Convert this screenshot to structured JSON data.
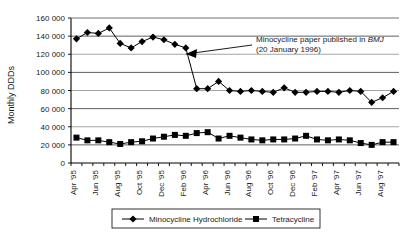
{
  "chart_data": {
    "type": "line",
    "title": "",
    "xlabel": "",
    "ylabel": "Monthly DDDs",
    "ylim": [
      0,
      160000
    ],
    "ytick_step": 20000,
    "grid": true,
    "legend_position": "bottom",
    "ytick_labels": [
      "0",
      "20 000",
      "40 000",
      "60 000",
      "80 000",
      "100 000",
      "120 000",
      "140 000",
      "160 000"
    ],
    "ytick_values": [
      0,
      20000,
      40000,
      60000,
      80000,
      100000,
      120000,
      140000,
      160000
    ],
    "x": [
      "Apr '95",
      "May '95",
      "Jun '95",
      "Jul '95",
      "Aug '95",
      "Sep '95",
      "Oct '95",
      "Nov '95",
      "Dec '95",
      "Jan '96",
      "Feb '96",
      "Mar '96",
      "Apr '96",
      "May '96",
      "Jun '96",
      "Jul '96",
      "Aug '96",
      "Sep '96",
      "Oct '96",
      "Nov '96",
      "Dec '96",
      "Jan '97",
      "Feb '97",
      "Mar '97",
      "Apr '97",
      "May '97",
      "Jun '97",
      "Jul '97",
      "Aug '97",
      "Sep '97"
    ],
    "xtick_labels": [
      "Apr '95",
      "",
      "Jun '95",
      "",
      "Aug '95",
      "",
      "Oct '95",
      "",
      "Dec '95",
      "",
      "Feb '96",
      "",
      "Apr '96",
      "",
      "Jun '96",
      "",
      "Aug '96",
      "",
      "Oct '96",
      "",
      "Dec '96",
      "",
      "Feb '97",
      "",
      "Apr '97",
      "",
      "Jun '97",
      "",
      "Aug '97",
      ""
    ],
    "xtick_labels_visible": [
      "Apr '95",
      "Jun '95",
      "Aug '95",
      "Oct '95",
      "Dec '95",
      "Feb '96",
      "Apr '96",
      "Jun '96",
      "Aug '96",
      "Oct '96",
      "Dec '96",
      "Feb '97",
      "Apr '97",
      "Jun '97",
      "Aug '97"
    ],
    "series": [
      {
        "name": "Minocycline Hydrochloride",
        "marker": "diamond",
        "color": "#000000",
        "values": [
          137000,
          144000,
          143000,
          149000,
          132000,
          127000,
          134000,
          139000,
          136000,
          131000,
          127000,
          82000,
          82000,
          90000,
          80000,
          79000,
          80000,
          79000,
          78000,
          83000,
          78000,
          78000,
          79000,
          79000,
          78000,
          80000,
          79000,
          67000,
          72000,
          79000
        ]
      },
      {
        "name": "Tetracycline",
        "marker": "square",
        "color": "#000000",
        "values": [
          28000,
          25000,
          25000,
          23000,
          21000,
          23000,
          24000,
          27000,
          29000,
          31000,
          30000,
          33000,
          34000,
          27000,
          30000,
          28000,
          26000,
          25000,
          26000,
          26000,
          27000,
          30000,
          26000,
          25000,
          26000,
          25000,
          22000,
          20000,
          23000,
          23000
        ]
      }
    ],
    "annotations": [
      {
        "text_line1_pre": "Minocycline paper published in ",
        "text_line1_em": "BMJ",
        "text_line2": "(20 January 1996)",
        "arrow_target_index": 10,
        "arrow_target_value": 128000
      }
    ],
    "legend": [
      {
        "label": "Minocycline Hydrochloride",
        "marker": "diamond"
      },
      {
        "label": "Tetracycline",
        "marker": "square"
      }
    ]
  }
}
